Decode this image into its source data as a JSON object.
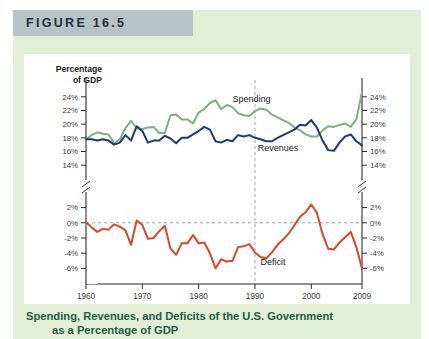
{
  "figure": {
    "header_label": "FIGURE 16.5",
    "caption_line1": "Spending, Revenues, and Deficits of the U.S. Government",
    "caption_line2": "as a Percentage of GDP"
  },
  "colors": {
    "spending": "#7cb07c",
    "revenues": "#1e3a6e",
    "deficit": "#d9472b",
    "page_bg": "#e3eed6",
    "header_bg": "#b9c2c6",
    "plot_bg": "#ffffff",
    "caption": "#1f5c44",
    "axis": "#2b2b2b",
    "guide": "#9aa39a"
  },
  "chart_data": {
    "type": "line",
    "title": "",
    "xlabel": "Year",
    "ylabel": "Percentage of GDP",
    "grid": false,
    "legend": "inline-annotations",
    "axis_break": {
      "between": [
        14,
        2
      ],
      "note": "broken y-axis"
    },
    "upper_panel": {
      "ylim": [
        13,
        25
      ],
      "yticks": [
        14,
        16,
        18,
        20,
        22,
        24
      ],
      "ytick_labels": [
        "14%",
        "16%",
        "18%",
        "20%",
        "22%",
        "24%"
      ]
    },
    "lower_panel": {
      "ylim": [
        -7,
        3
      ],
      "yticks": [
        -6,
        -4,
        -2,
        0,
        2
      ],
      "ytick_labels": [
        "-6%",
        "-4%",
        "-2%",
        "0%",
        "2%"
      ]
    },
    "xlim": [
      1960,
      2009
    ],
    "xticks": [
      1960,
      1970,
      1980,
      1990,
      2000,
      2009
    ],
    "xtick_labels": [
      "1960",
      "1970",
      "1980",
      "1990",
      "2000",
      "2009"
    ],
    "reference_lines": [
      {
        "axis": "x",
        "value": 1990,
        "style": "dashed"
      },
      {
        "axis": "y",
        "value": 0,
        "style": "dashed",
        "panel": "lower"
      }
    ],
    "annotations": [
      {
        "text": "Spending",
        "x": 1986,
        "y": 23.2,
        "panel": "upper"
      },
      {
        "text": "Revenues",
        "x": 1990.5,
        "y": 16.1,
        "panel": "upper"
      },
      {
        "text": "Deficit",
        "x": 1991,
        "y": -5.6,
        "panel": "lower"
      }
    ],
    "x": [
      1960,
      1961,
      1962,
      1963,
      1964,
      1965,
      1966,
      1967,
      1968,
      1969,
      1970,
      1971,
      1972,
      1973,
      1974,
      1975,
      1976,
      1977,
      1978,
      1979,
      1980,
      1981,
      1982,
      1983,
      1984,
      1985,
      1986,
      1987,
      1988,
      1989,
      1990,
      1991,
      1992,
      1993,
      1994,
      1995,
      1996,
      1997,
      1998,
      1999,
      2000,
      2001,
      2002,
      2003,
      2004,
      2005,
      2006,
      2007,
      2008,
      2009
    ],
    "series": [
      {
        "name": "Spending",
        "color": "#7cb07c",
        "panel": "upper",
        "values": [
          17.8,
          18.4,
          18.8,
          18.6,
          18.5,
          17.2,
          17.8,
          19.4,
          20.5,
          19.4,
          19.3,
          19.5,
          19.6,
          18.7,
          18.7,
          21.3,
          21.4,
          20.7,
          20.7,
          20.1,
          21.7,
          22.2,
          23.1,
          23.5,
          22.2,
          22.8,
          22.5,
          21.6,
          21.3,
          21.2,
          21.9,
          22.3,
          22.1,
          21.4,
          21.0,
          20.6,
          20.2,
          19.5,
          19.1,
          18.5,
          18.2,
          18.2,
          19.1,
          19.7,
          19.6,
          19.9,
          20.1,
          19.6,
          20.7,
          24.7
        ]
      },
      {
        "name": "Revenues",
        "color": "#1e3a6e",
        "panel": "upper",
        "values": [
          17.8,
          17.8,
          17.6,
          17.8,
          17.6,
          17.0,
          17.3,
          18.4,
          17.6,
          19.7,
          19.0,
          17.3,
          17.6,
          17.6,
          18.3,
          17.9,
          17.2,
          18.0,
          18.0,
          18.5,
          19.0,
          19.6,
          19.2,
          17.5,
          17.3,
          17.7,
          17.5,
          18.4,
          18.2,
          18.4,
          18.0,
          17.8,
          17.5,
          17.5,
          18.0,
          18.4,
          18.8,
          19.2,
          19.9,
          19.8,
          20.6,
          19.5,
          17.6,
          16.2,
          16.1,
          17.3,
          18.2,
          18.5,
          17.5,
          16.9
        ]
      },
      {
        "name": "Deficit",
        "color": "#d9472b",
        "panel": "lower",
        "values": [
          0.1,
          -0.6,
          -1.2,
          -0.8,
          -0.9,
          -0.2,
          -0.5,
          -1.0,
          -2.9,
          0.3,
          -0.3,
          -2.1,
          -2.0,
          -1.1,
          -0.4,
          -3.4,
          -4.2,
          -2.7,
          -2.7,
          -1.6,
          -2.7,
          -2.6,
          -4.0,
          -6.0,
          -4.8,
          -5.1,
          -5.0,
          -3.2,
          -3.1,
          -2.8,
          -3.9,
          -4.5,
          -4.7,
          -3.9,
          -2.9,
          -2.2,
          -1.4,
          -0.3,
          0.8,
          1.4,
          2.4,
          1.3,
          -1.5,
          -3.4,
          -3.5,
          -2.6,
          -1.9,
          -1.2,
          -3.2,
          -6.0
        ]
      }
    ]
  }
}
